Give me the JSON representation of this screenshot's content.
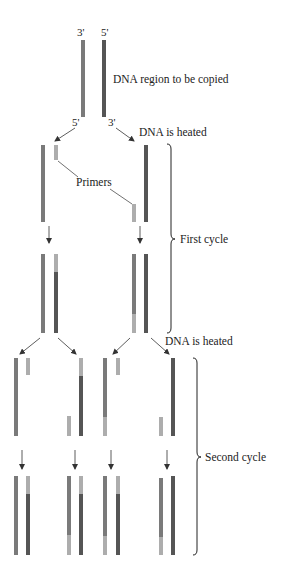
{
  "diagram": {
    "colors": {
      "background": "#ffffff",
      "template_strand_medium": "#7a7a7a",
      "template_strand_dark": "#555555",
      "primer_light": "#adadad",
      "arrow": "#333333",
      "text": "#222222"
    },
    "labels": {
      "top_three_prime": "3'",
      "top_five_prime": "5'",
      "region": "DNA region to be copied",
      "split_five_prime": "5'",
      "split_three_prime": "3'",
      "heated_1": "DNA is heated",
      "primers": "Primers",
      "first_cycle": "First cycle",
      "heated_2": "DNA is heated",
      "second_cycle": "Second cycle"
    },
    "strand_legend": [
      {
        "name": "original-strand-a",
        "color": "#7a7a7a"
      },
      {
        "name": "original-strand-b",
        "color": "#555555"
      },
      {
        "name": "primer-new-segment",
        "color": "#adadad"
      }
    ],
    "stages": [
      {
        "name": "original-double-strand",
        "strands": 2
      },
      {
        "name": "first-cycle-separated",
        "strands": 2,
        "primers": 2
      },
      {
        "name": "first-cycle-products",
        "double_strands": 2
      },
      {
        "name": "second-cycle-separated",
        "strands": 4,
        "primers": 4
      },
      {
        "name": "second-cycle-products",
        "double_strands": 4
      }
    ]
  }
}
